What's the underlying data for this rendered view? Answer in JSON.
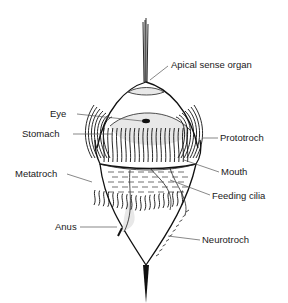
{
  "labels": {
    "apical_sense_organ": "Apical sense organ",
    "eye": "Eye",
    "stomach": "Stomach",
    "prototroch": "Prototroch",
    "mouth": "Mouth",
    "metatroch": "Metatroch",
    "feeding_cilia": "Feeding cilia",
    "anus": "Anus",
    "neurotroch": "Neurotroch"
  },
  "colors": {
    "ink": "#111111",
    "background": "#ffffff",
    "leader_line": "#555555"
  }
}
